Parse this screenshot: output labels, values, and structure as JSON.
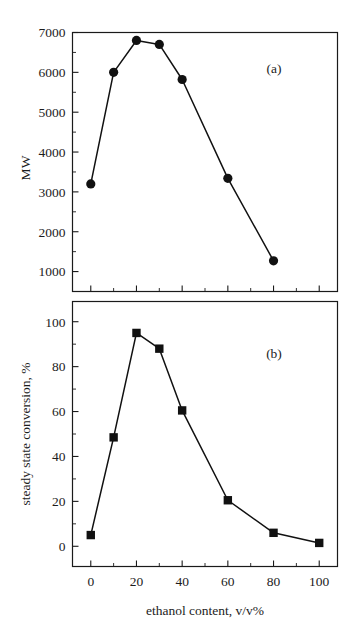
{
  "figure": {
    "panel_a_label": "(a)",
    "panel_b_label": "(b)",
    "shared_xlabel": "ethanol content, v/v%"
  },
  "chart_data": [
    {
      "type": "line",
      "panel": "(a)",
      "title": "",
      "xlabel": "",
      "ylabel": "MW",
      "xlim": [
        -8,
        108
      ],
      "ylim": [
        500,
        7000
      ],
      "grid": false,
      "legend": "none",
      "marker": "filled-circle",
      "x_tick_labels": [
        "",
        "",
        "",
        "",
        "",
        ""
      ],
      "x_major_ticks": [
        0,
        20,
        40,
        60,
        80,
        100
      ],
      "x_minor_ticks": [
        10,
        30,
        50,
        70,
        90
      ],
      "y_major_ticks": [
        1000,
        2000,
        3000,
        4000,
        5000,
        6000,
        7000
      ],
      "y_tick_labels": [
        "1000",
        "2000",
        "3000",
        "4000",
        "5000",
        "6000",
        "7000"
      ],
      "y_minor_ticks": [
        1500,
        2500,
        3500,
        4500,
        5500,
        6500
      ],
      "x": [
        0,
        10,
        20,
        30,
        40,
        60,
        80
      ],
      "values": [
        3200,
        6000,
        6800,
        6700,
        5820,
        3340,
        1270
      ]
    },
    {
      "type": "line",
      "panel": "(b)",
      "title": "",
      "xlabel": "ethanol content, v/v%",
      "ylabel": "steady state conversion, %",
      "xlim": [
        -8,
        108
      ],
      "ylim": [
        -9,
        109
      ],
      "grid": false,
      "legend": "none",
      "marker": "filled-square",
      "x_major_ticks": [
        0,
        20,
        40,
        60,
        80,
        100
      ],
      "x_tick_labels": [
        "0",
        "20",
        "40",
        "60",
        "80",
        "100"
      ],
      "x_minor_ticks": [
        10,
        30,
        50,
        70,
        90
      ],
      "y_major_ticks": [
        0,
        20,
        40,
        60,
        80,
        100
      ],
      "y_tick_labels": [
        "0",
        "20",
        "40",
        "60",
        "80",
        "100"
      ],
      "y_minor_ticks": [
        10,
        30,
        50,
        70,
        90
      ],
      "x": [
        0,
        10,
        20,
        30,
        40,
        60,
        80,
        100
      ],
      "values": [
        5,
        48.5,
        95,
        88,
        60.5,
        20.5,
        6,
        1.5
      ]
    }
  ]
}
